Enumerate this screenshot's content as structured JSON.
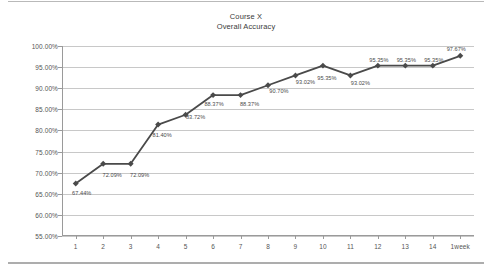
{
  "chart_data": {
    "type": "line",
    "title": "Course X",
    "subtitle": "Overall Accuracy",
    "xlabel": "",
    "ylabel": "",
    "ylim": [
      55,
      100
    ],
    "ytick_step": 5,
    "grid": true,
    "legend": false,
    "legend_position": "none",
    "series_color": "#4a4a4a",
    "categories": [
      "1",
      "2",
      "3",
      "4",
      "5",
      "6",
      "7",
      "8",
      "9",
      "10",
      "11",
      "12",
      "13",
      "14",
      "1week"
    ],
    "values": [
      67.44,
      72.09,
      72.09,
      81.4,
      83.72,
      88.37,
      88.37,
      90.7,
      93.02,
      95.35,
      93.02,
      95.35,
      95.35,
      95.35,
      97.67
    ],
    "data_labels": [
      "67.44%",
      "72.09%",
      "72.09%",
      "81.40%",
      "83.72%",
      "88.37%",
      "88.37%",
      "90.70%",
      "93.02%",
      "95.35%",
      "93.02%",
      "95.35%",
      "95.35%",
      "95.35%",
      "97.67%"
    ],
    "ytick_labels": [
      "100.00%",
      "95.00%",
      "90.00%",
      "85.00%",
      "80.00%",
      "75.00%",
      "70.00%",
      "65.00%",
      "60.00%",
      "55.00%"
    ],
    "ytick_values": [
      100,
      95,
      90,
      85,
      80,
      75,
      70,
      65,
      60,
      55
    ],
    "label_offsets": [
      {
        "dx": 6,
        "dy": 7
      },
      {
        "dx": 9,
        "dy": 8
      },
      {
        "dx": 9,
        "dy": 8
      },
      {
        "dx": 4,
        "dy": 7
      },
      {
        "dx": 10,
        "dy": -1
      },
      {
        "dx": 1,
        "dy": 6
      },
      {
        "dx": 9,
        "dy": 6
      },
      {
        "dx": 11,
        "dy": 3
      },
      {
        "dx": 10,
        "dy": 4
      },
      {
        "dx": 4,
        "dy": 9
      },
      {
        "dx": 10,
        "dy": 5
      },
      {
        "dx": 1,
        "dy": -9
      },
      {
        "dx": 1,
        "dy": -9
      },
      {
        "dx": 1,
        "dy": -9
      },
      {
        "dx": -4,
        "dy": -10
      }
    ]
  }
}
